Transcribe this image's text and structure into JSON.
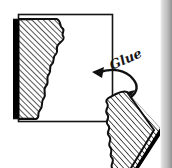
{
  "figure": {
    "background_color": "#ffffff",
    "ink_color": "#111111",
    "shadow_color": "#000000",
    "hatch_color": "#1a1a1a",
    "annotations": [
      {
        "name": "glue-label",
        "text": "Glue",
        "style": "handwritten-italic"
      }
    ],
    "shapes": [
      {
        "name": "board-outline-square",
        "kind": "square-outline",
        "description": "Open square outline representing the board face"
      },
      {
        "name": "molding-piece-left",
        "kind": "hatched-profile",
        "description": "Vertical molding strip with wavy profiled right edge and solid black left edge"
      },
      {
        "name": "molding-piece-loose",
        "kind": "hatched-profile",
        "description": "Diagonal loose molding piece at lower right with wavy left edge and black shadow"
      },
      {
        "name": "glue-arrow",
        "kind": "curved-arrow",
        "description": "Curved arrow sweeping from the loose piece to the board, pointing left"
      }
    ]
  },
  "edge_strip": {
    "name": "page-edge-strip",
    "visible": true,
    "light_color": "#d8d8d8",
    "mid_color": "#b6b6b6",
    "dark_color": "#909090"
  }
}
